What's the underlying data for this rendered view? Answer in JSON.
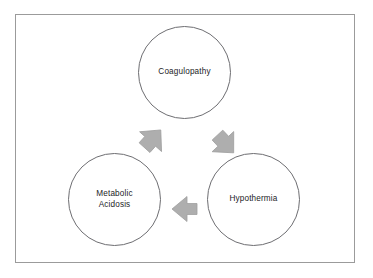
{
  "diagram": {
    "type": "cycle-diagram",
    "title": "",
    "frame": {
      "border_color": "#9b9b9b",
      "background_color": "#ffffff"
    },
    "node_style": {
      "shape": "circle",
      "outline_color": "#6e6e72",
      "fill_color": "#ffffff",
      "text_color": "#232326"
    },
    "arrow_style": {
      "fill_color": "#aeaeae",
      "outline_color": "#a0a0a0",
      "shape": "block-arrow"
    },
    "nodes": [
      {
        "id": "coagulopathy",
        "label": "Coagulopathy",
        "position": "top-center"
      },
      {
        "id": "metabolic-acidosis",
        "label": "Metabolic\nAcidosis",
        "position": "bottom-left"
      },
      {
        "id": "hypothermia",
        "label": "Hypothermia",
        "position": "bottom-right"
      }
    ],
    "arrows": [
      {
        "id": "acidosis-to-coagulopathy",
        "from": "metabolic-acidosis",
        "to": "coagulopathy",
        "direction": "up-right"
      },
      {
        "id": "coagulopathy-to-hypothermia",
        "from": "coagulopathy",
        "to": "hypothermia",
        "direction": "down-right"
      },
      {
        "id": "hypothermia-to-acidosis",
        "from": "hypothermia",
        "to": "metabolic-acidosis",
        "direction": "left"
      }
    ]
  }
}
